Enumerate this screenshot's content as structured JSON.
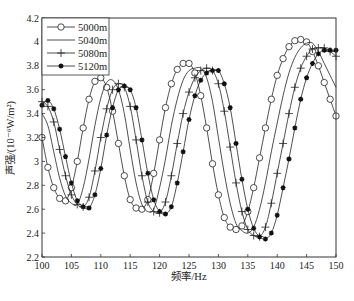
{
  "chart_data": {
    "type": "line",
    "title": "",
    "xlabel": "频率/Hz",
    "ylabel": "声强/(10⁻⁶W/m²)",
    "xlim": [
      100,
      150
    ],
    "ylim": [
      2.2,
      4.2
    ],
    "xticks": [
      100,
      105,
      110,
      115,
      120,
      125,
      130,
      135,
      140,
      145,
      150
    ],
    "yticks": [
      2.2,
      2.4,
      2.6,
      2.8,
      3,
      3.2,
      3.4,
      3.6,
      3.8,
      4,
      4.2
    ],
    "grid": false,
    "legend_position": "upper-left",
    "x": [
      100,
      101,
      102,
      103,
      104,
      105,
      106,
      107,
      108,
      109,
      110,
      111,
      112,
      113,
      114,
      115,
      116,
      117,
      118,
      119,
      120,
      121,
      122,
      123,
      124,
      125,
      126,
      127,
      128,
      129,
      130,
      131,
      132,
      133,
      134,
      135,
      136,
      137,
      138,
      139,
      140,
      141,
      142,
      143,
      144,
      145,
      146,
      147,
      148,
      149,
      150
    ],
    "series": [
      {
        "name": "5000m",
        "marker": "circle",
        "values": [
          3.2,
          2.95,
          2.78,
          2.69,
          2.67,
          2.78,
          3.0,
          3.28,
          3.52,
          3.67,
          3.7,
          3.62,
          3.42,
          3.15,
          2.88,
          2.68,
          2.61,
          2.6,
          2.68,
          2.9,
          3.18,
          3.45,
          3.65,
          3.77,
          3.82,
          3.82,
          3.74,
          3.55,
          3.28,
          2.98,
          2.72,
          2.53,
          2.45,
          2.43,
          2.46,
          2.58,
          2.78,
          3.03,
          3.28,
          3.52,
          3.72,
          3.86,
          3.96,
          4.01,
          4.02,
          4.0,
          3.92,
          3.8,
          3.66,
          3.52,
          3.38
        ]
      },
      {
        "name": "5040m",
        "marker": "none",
        "values": [
          3.4,
          3.3,
          3.08,
          2.86,
          2.71,
          2.65,
          2.64,
          2.78,
          3.02,
          3.3,
          3.53,
          3.66,
          3.68,
          3.6,
          3.4,
          3.1,
          2.82,
          2.64,
          2.58,
          2.6,
          2.78,
          3.02,
          3.3,
          3.52,
          3.68,
          3.76,
          3.78,
          3.78,
          3.7,
          3.5,
          3.2,
          2.9,
          2.65,
          2.48,
          2.42,
          2.4,
          2.45,
          2.6,
          2.82,
          3.08,
          3.32,
          3.55,
          3.74,
          3.87,
          3.95,
          3.99,
          3.99,
          3.92,
          3.82,
          3.72,
          3.62
        ]
      },
      {
        "name": "5080m",
        "marker": "plus",
        "values": [
          3.5,
          3.46,
          3.33,
          3.1,
          2.88,
          2.72,
          2.64,
          2.62,
          2.7,
          2.92,
          3.2,
          3.44,
          3.6,
          3.65,
          3.62,
          3.46,
          3.18,
          2.88,
          2.66,
          2.58,
          2.57,
          2.66,
          2.88,
          3.15,
          3.4,
          3.58,
          3.7,
          3.76,
          3.78,
          3.76,
          3.65,
          3.42,
          3.12,
          2.82,
          2.58,
          2.43,
          2.38,
          2.37,
          2.45,
          2.65,
          2.9,
          3.15,
          3.4,
          3.62,
          3.78,
          3.88,
          3.94,
          3.95,
          3.95,
          3.92,
          3.88
        ]
      },
      {
        "name": "5120m",
        "marker": "star",
        "values": [
          3.47,
          3.51,
          3.44,
          3.27,
          3.04,
          2.82,
          2.67,
          2.62,
          2.61,
          2.72,
          2.94,
          3.22,
          3.45,
          3.6,
          3.63,
          3.6,
          3.45,
          3.18,
          2.9,
          2.68,
          2.58,
          2.56,
          2.62,
          2.82,
          3.08,
          3.35,
          3.55,
          3.68,
          3.74,
          3.76,
          3.76,
          3.65,
          3.45,
          3.15,
          2.85,
          2.6,
          2.44,
          2.37,
          2.35,
          2.4,
          2.55,
          2.78,
          3.02,
          3.28,
          3.52,
          3.7,
          3.82,
          3.9,
          3.93,
          3.93,
          3.93
        ]
      }
    ]
  },
  "axes": {
    "xlabel": "频率/Hz",
    "ylabel": "声强/(10⁻⁶W/m²)"
  },
  "legend": [
    {
      "label": "5000m"
    },
    {
      "label": "5040m"
    },
    {
      "label": "5080m"
    },
    {
      "label": "5120m"
    }
  ]
}
